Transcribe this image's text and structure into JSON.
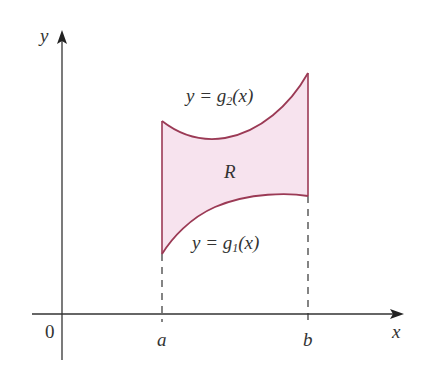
{
  "diagram": {
    "type": "region between curves",
    "colors": {
      "axis": "#333333",
      "curve": "#9b3a55",
      "fill": "#f7e3ee"
    },
    "axes": {
      "x_label": "x",
      "y_label": "y",
      "origin_label": "0"
    },
    "ticks": {
      "a": "a",
      "b": "b"
    },
    "region_label": "R",
    "upper_curve": {
      "lhs": "y = g",
      "sub": "2",
      "rhs": "(x)"
    },
    "lower_curve": {
      "lhs": "y = g",
      "sub": "1",
      "rhs": "(x)"
    }
  }
}
